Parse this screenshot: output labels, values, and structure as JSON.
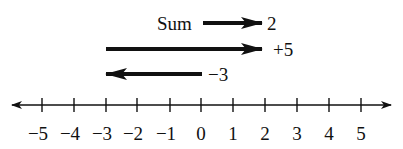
{
  "diagram": {
    "type": "number-line-addition",
    "number_line": {
      "min": -5,
      "max": 5,
      "ticks": [
        "−5",
        "−4",
        "−3",
        "−2",
        "−1",
        "0",
        "1",
        "2",
        "3",
        "4",
        "5"
      ],
      "arrows_both_ends": true
    },
    "vectors": [
      {
        "id": "neg3",
        "label": "−3",
        "from": 0,
        "to": -3
      },
      {
        "id": "pos5",
        "label": "+5",
        "from": -3,
        "to": 2
      },
      {
        "id": "sum",
        "label": "2",
        "prefix": "Sum",
        "from": 0,
        "to": 2
      }
    ],
    "sum_label": "Sum"
  },
  "colors": {
    "stroke": "#111111",
    "background": "#ffffff"
  }
}
